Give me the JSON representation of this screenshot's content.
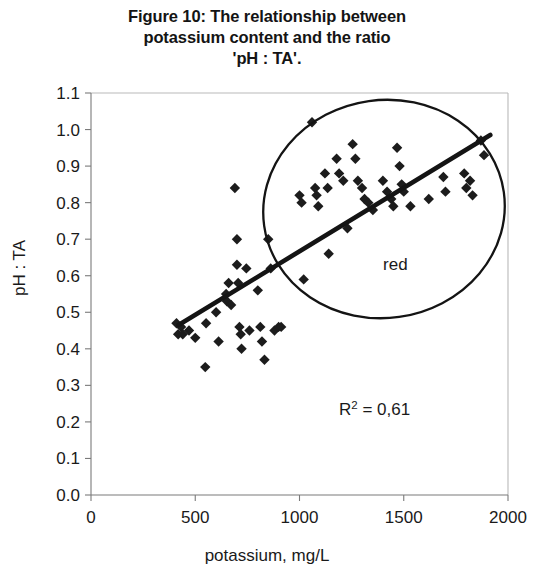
{
  "chart_data": {
    "type": "scatter",
    "title": "Figure 10: The relationship between potassium content and the ratio 'pH : TA'.",
    "title_lines": [
      "Figure 10: The relationship between",
      "potassium content and the ratio",
      "'pH : TA'."
    ],
    "xlabel": "potassium, mg/L",
    "ylabel": "pH : TA",
    "xlim": [
      0,
      2000
    ],
    "ylim": [
      0.0,
      1.1
    ],
    "xticks": [
      0,
      500,
      1000,
      1500,
      2000
    ],
    "xtick_labels": [
      "0",
      "500",
      "1000",
      "1500",
      "2000"
    ],
    "yticks": [
      0.0,
      0.1,
      0.2,
      0.3,
      0.4,
      0.5,
      0.6,
      0.7,
      0.8,
      0.9,
      1.0,
      1.1
    ],
    "ytick_labels": [
      "0.0",
      "0.1",
      "0.2",
      "0.3",
      "0.4",
      "0.5",
      "0.6",
      "0.7",
      "0.8",
      "0.9",
      "1.0",
      "1.1"
    ],
    "grid": false,
    "legend": false,
    "marker": "diamond",
    "marker_color": "#1c1c1c",
    "points": [
      {
        "x": 410,
        "y": 0.47
      },
      {
        "x": 418,
        "y": 0.44
      },
      {
        "x": 432,
        "y": 0.46
      },
      {
        "x": 440,
        "y": 0.44
      },
      {
        "x": 470,
        "y": 0.45
      },
      {
        "x": 500,
        "y": 0.43
      },
      {
        "x": 548,
        "y": 0.35
      },
      {
        "x": 552,
        "y": 0.47
      },
      {
        "x": 600,
        "y": 0.5
      },
      {
        "x": 612,
        "y": 0.42
      },
      {
        "x": 648,
        "y": 0.55
      },
      {
        "x": 652,
        "y": 0.53
      },
      {
        "x": 660,
        "y": 0.58
      },
      {
        "x": 672,
        "y": 0.52
      },
      {
        "x": 690,
        "y": 0.84
      },
      {
        "x": 700,
        "y": 0.7
      },
      {
        "x": 700,
        "y": 0.63
      },
      {
        "x": 706,
        "y": 0.58
      },
      {
        "x": 712,
        "y": 0.46
      },
      {
        "x": 718,
        "y": 0.44
      },
      {
        "x": 722,
        "y": 0.4
      },
      {
        "x": 745,
        "y": 0.62
      },
      {
        "x": 760,
        "y": 0.45
      },
      {
        "x": 800,
        "y": 0.56
      },
      {
        "x": 812,
        "y": 0.46
      },
      {
        "x": 820,
        "y": 0.42
      },
      {
        "x": 832,
        "y": 0.37
      },
      {
        "x": 850,
        "y": 0.7
      },
      {
        "x": 862,
        "y": 0.62
      },
      {
        "x": 880,
        "y": 0.45
      },
      {
        "x": 900,
        "y": 0.46
      },
      {
        "x": 912,
        "y": 0.46
      },
      {
        "x": 1000,
        "y": 0.82
      },
      {
        "x": 1010,
        "y": 0.8
      },
      {
        "x": 1020,
        "y": 0.59
      },
      {
        "x": 1060,
        "y": 1.02
      },
      {
        "x": 1075,
        "y": 0.84
      },
      {
        "x": 1082,
        "y": 0.82
      },
      {
        "x": 1090,
        "y": 0.79
      },
      {
        "x": 1122,
        "y": 0.88
      },
      {
        "x": 1135,
        "y": 0.84
      },
      {
        "x": 1140,
        "y": 0.66
      },
      {
        "x": 1178,
        "y": 0.92
      },
      {
        "x": 1190,
        "y": 0.88
      },
      {
        "x": 1210,
        "y": 0.86
      },
      {
        "x": 1230,
        "y": 0.73
      },
      {
        "x": 1255,
        "y": 0.96
      },
      {
        "x": 1268,
        "y": 0.92
      },
      {
        "x": 1280,
        "y": 0.86
      },
      {
        "x": 1300,
        "y": 0.84
      },
      {
        "x": 1312,
        "y": 0.81
      },
      {
        "x": 1330,
        "y": 0.8
      },
      {
        "x": 1352,
        "y": 0.78
      },
      {
        "x": 1400,
        "y": 0.86
      },
      {
        "x": 1420,
        "y": 0.83
      },
      {
        "x": 1440,
        "y": 0.81
      },
      {
        "x": 1450,
        "y": 0.79
      },
      {
        "x": 1468,
        "y": 0.95
      },
      {
        "x": 1480,
        "y": 0.9
      },
      {
        "x": 1490,
        "y": 0.85
      },
      {
        "x": 1500,
        "y": 0.83
      },
      {
        "x": 1532,
        "y": 0.79
      },
      {
        "x": 1620,
        "y": 0.81
      },
      {
        "x": 1690,
        "y": 0.87
      },
      {
        "x": 1700,
        "y": 0.83
      },
      {
        "x": 1790,
        "y": 0.88
      },
      {
        "x": 1800,
        "y": 0.84
      },
      {
        "x": 1818,
        "y": 0.86
      },
      {
        "x": 1830,
        "y": 0.82
      },
      {
        "x": 1870,
        "y": 0.97
      },
      {
        "x": 1885,
        "y": 0.93
      }
    ],
    "trendline": {
      "x_start": 420,
      "y_start": 0.465,
      "x_end": 1915,
      "y_end": 0.985,
      "color": "#141414"
    },
    "annotations": [
      {
        "name": "r-squared",
        "text_main": "R",
        "text_sup": "2",
        "text_rest": " = 0,61",
        "x": 1360,
        "y": 0.22
      },
      {
        "name": "group-label-red",
        "text": "red",
        "x": 1460,
        "y": 0.615
      }
    ],
    "ellipse": {
      "label": "red",
      "cx_px": 384,
      "cy_px": 209,
      "rx_px": 121,
      "ry_px": 109,
      "rotation": -8,
      "color": "#141414"
    }
  }
}
